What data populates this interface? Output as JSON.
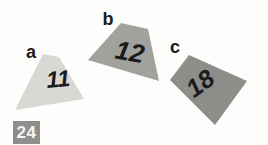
{
  "figure": {
    "ink": "#1b1b1b",
    "background": "#fdfdfc",
    "shapes": [
      {
        "letter": "a",
        "number": "11",
        "fill": "#d8d8d5"
      },
      {
        "letter": "b",
        "number": "12",
        "fill": "#a1a19e"
      },
      {
        "letter": "c",
        "number": "18",
        "fill": "#8d8d8a"
      }
    ],
    "corner_badge": {
      "number": "24",
      "background": "#8e8e8c",
      "color": "#f6f5f2"
    }
  }
}
